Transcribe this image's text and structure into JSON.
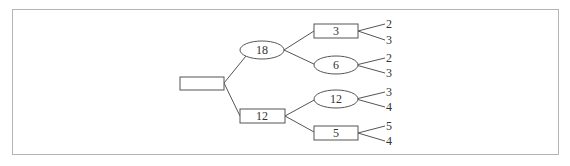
{
  "diagram": {
    "type": "factor-tree",
    "root": {
      "label": "",
      "shape": "rect"
    },
    "level1": [
      {
        "label": "18",
        "shape": "ellipse"
      },
      {
        "label": "12",
        "shape": "rect"
      }
    ],
    "level2": [
      {
        "label": "3",
        "shape": "rect",
        "parent": "18"
      },
      {
        "label": "6",
        "shape": "ellipse",
        "parent": "18"
      },
      {
        "label": "12",
        "shape": "ellipse",
        "parent": "12"
      },
      {
        "label": "5",
        "shape": "rect",
        "parent": "12"
      }
    ],
    "leaves": [
      {
        "label": "2",
        "parent": "3"
      },
      {
        "label": "3",
        "parent": "3"
      },
      {
        "label": "2",
        "parent": "6"
      },
      {
        "label": "3",
        "parent": "6"
      },
      {
        "label": "3",
        "parent": "12"
      },
      {
        "label": "4",
        "parent": "12"
      },
      {
        "label": "5",
        "parent": "5"
      },
      {
        "label": "4",
        "parent": "5"
      }
    ]
  }
}
